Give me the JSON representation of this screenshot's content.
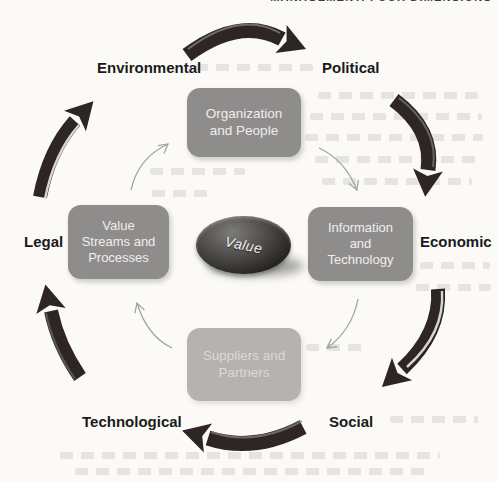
{
  "page_header": {
    "clipped_text": "MANAGEMENT: FOUR DIMENSIONS"
  },
  "diagram": {
    "center_label": "Value",
    "dimensions": {
      "top": "Organization\nand People",
      "right": "Information\nand\nTechnology",
      "bottom": "Suppliers and\nPartners",
      "left": "Value\nStreams and\nProcesses"
    },
    "pestle_factors": {
      "top_left": "Environmental",
      "top_right": "Political",
      "right": "Economic",
      "bottom_right": "Social",
      "bottom_left": "Technological",
      "left": "Legal"
    },
    "cycle_direction": "clockwise",
    "colors": {
      "dimension_box": "#8f8d8c",
      "dimension_box_faded": "#b5b2b0",
      "outer_arrow": "#2d2526",
      "inner_arrow": "#a3a3a3",
      "value_ellipse_dark": "#232020",
      "label_text": "#1b1b1b"
    }
  }
}
